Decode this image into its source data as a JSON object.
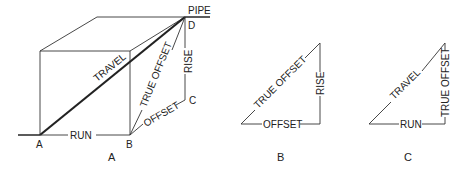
{
  "figure_a": {
    "caption": "A",
    "labels": {
      "pipe": "PIPE",
      "point_a": "A",
      "point_b": "B",
      "point_c": "C",
      "point_d": "D",
      "travel": "TRAVEL",
      "true_offset": "TRUE OFFSET",
      "rise": "RISE",
      "offset": "OFFSET",
      "run": "RUN"
    }
  },
  "figure_b": {
    "caption": "B",
    "labels": {
      "true_offset": "TRUE OFFSET",
      "rise": "RISE",
      "offset": "OFFSET"
    }
  },
  "figure_c": {
    "caption": "C",
    "labels": {
      "travel": "TRAVEL",
      "true_offset": "TRUE OFFSET",
      "run": "RUN"
    }
  }
}
